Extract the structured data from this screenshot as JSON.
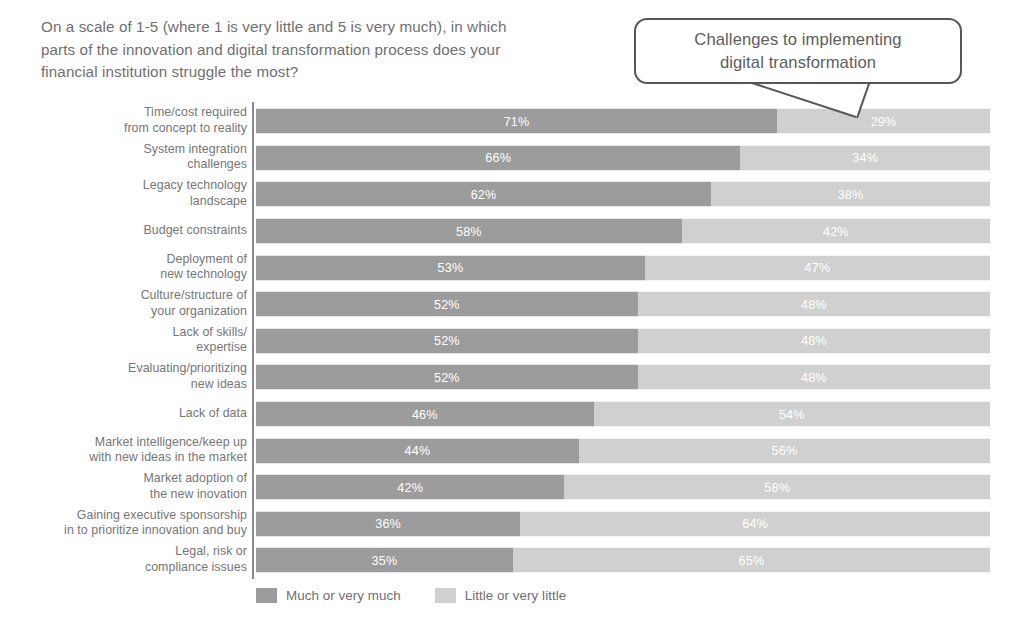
{
  "question": {
    "lines": [
      "On a scale of 1-5 (where 1 is very little and 5 is very much), in which",
      "parts of the innovation and digital transformation process does your",
      "financial institution struggle the most?"
    ]
  },
  "callout": {
    "lines": [
      "Challenges to implementing",
      "digital transformation"
    ]
  },
  "legend": {
    "items": [
      {
        "label": "Much or very much",
        "color": "#9c9c9c"
      },
      {
        "label": "Little or very little",
        "color": "#d0d0d0"
      }
    ]
  },
  "chart_data": {
    "type": "bar",
    "subtype": "stacked-horizontal-100",
    "title": "Challenges to implementing digital transformation",
    "xlabel": "",
    "ylabel": "",
    "xlim": [
      0,
      100
    ],
    "grid": false,
    "legend_position": "bottom-left",
    "value_suffix": "%",
    "categories": [
      "Time/cost required from concept to reality",
      "System integration challenges",
      "Legacy technology landscape",
      "Budget constraints",
      "Deployment of new technology",
      "Culture/structure of your organization",
      "Lack of skills/ expertise",
      "Evaluating/prioritizing new ideas",
      "Lack of data",
      "Market intelligence/keep up with new ideas in the market",
      "Market adoption of the new inovation",
      "Gaining executive sponsorship in to prioritize innovation and buy",
      "Legal, risk or compliance issues"
    ],
    "category_lines": [
      [
        "Time/cost required",
        "from concept to reality"
      ],
      [
        "System integration",
        "challenges"
      ],
      [
        "Legacy technology",
        "landscape"
      ],
      [
        "Budget constraints"
      ],
      [
        "Deployment of",
        "new technology"
      ],
      [
        "Culture/structure of",
        "your organization"
      ],
      [
        "Lack of skills/",
        "expertise"
      ],
      [
        "Evaluating/prioritizing",
        "new ideas"
      ],
      [
        "Lack of data"
      ],
      [
        "Market intelligence/keep up",
        "with new ideas in the market"
      ],
      [
        "Market adoption of",
        "the new inovation"
      ],
      [
        "Gaining executive sponsorship",
        "in to prioritize innovation and buy"
      ],
      [
        "Legal, risk or",
        "compliance issues"
      ]
    ],
    "series": [
      {
        "name": "Much or very much",
        "color": "#9c9c9c",
        "values": [
          71,
          66,
          62,
          58,
          53,
          52,
          52,
          52,
          46,
          44,
          42,
          36,
          35
        ],
        "labels": [
          "71%",
          "66%",
          "62%",
          "58%",
          "53%",
          "52%",
          "52%",
          "52%",
          "46%",
          "44%",
          "42%",
          "36%",
          "35%"
        ]
      },
      {
        "name": "Little or very little",
        "color": "#d0d0d0",
        "values": [
          29,
          34,
          38,
          42,
          47,
          48,
          48,
          48,
          54,
          56,
          58,
          64,
          65
        ],
        "labels": [
          "29%",
          "34%",
          "38%",
          "42%",
          "47%",
          "48%",
          "48%",
          "48%",
          "54%",
          "56%",
          "58%",
          "64%",
          "65%"
        ]
      }
    ]
  }
}
